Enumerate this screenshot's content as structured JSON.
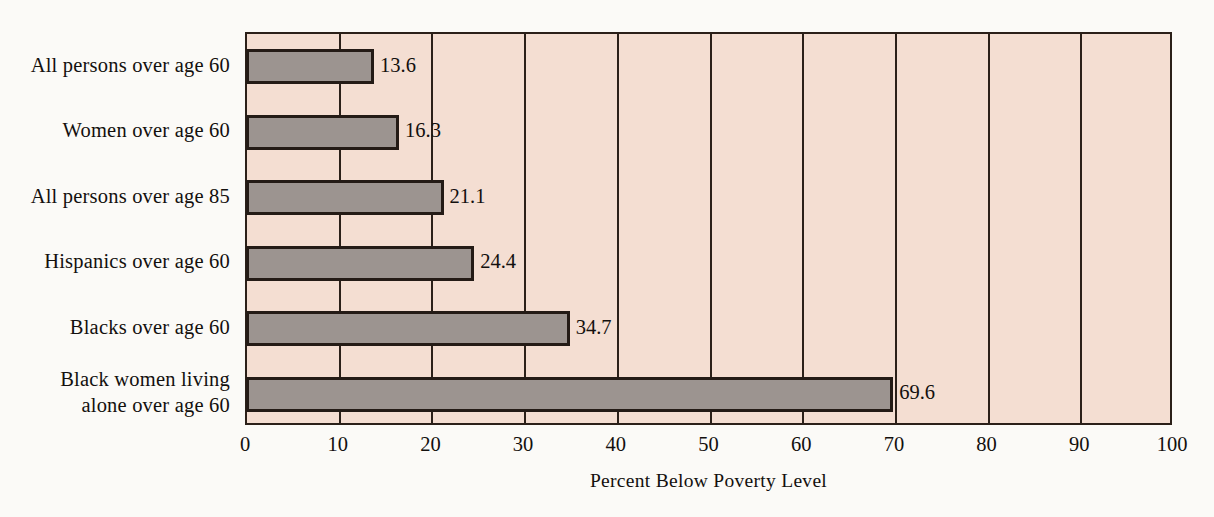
{
  "chart_data": {
    "type": "bar",
    "orientation": "horizontal",
    "title": "",
    "xlabel": "Percent Below Poverty Level",
    "ylabel": "",
    "xlim": [
      0,
      100
    ],
    "xticks": [
      0,
      10,
      20,
      30,
      40,
      50,
      60,
      70,
      80,
      90,
      100
    ],
    "tick_labels": [
      "0",
      "10",
      "20",
      "30",
      "40",
      "50",
      "60",
      "70",
      "80",
      "90",
      "100"
    ],
    "grid": "vertical",
    "legend": "none",
    "categories": [
      "All persons over age 60",
      "Women over age 60",
      "All persons over age 85",
      "Hispanics over age 60",
      "Blacks over age 60",
      "Black women living\nalone over age 60"
    ],
    "values": [
      13.6,
      16.3,
      21.1,
      24.4,
      34.7,
      69.6
    ],
    "value_labels": [
      "13.6",
      "16.3",
      "21.1",
      "24.4",
      "34.7",
      "69.6"
    ],
    "colors": {
      "bar_fill": "#9c9490",
      "bar_outline": "#241b16",
      "plot_background": "#f4ded2",
      "page_background": "#fbfaf7",
      "text": "#13100e",
      "gridline": "#2b2019"
    }
  }
}
